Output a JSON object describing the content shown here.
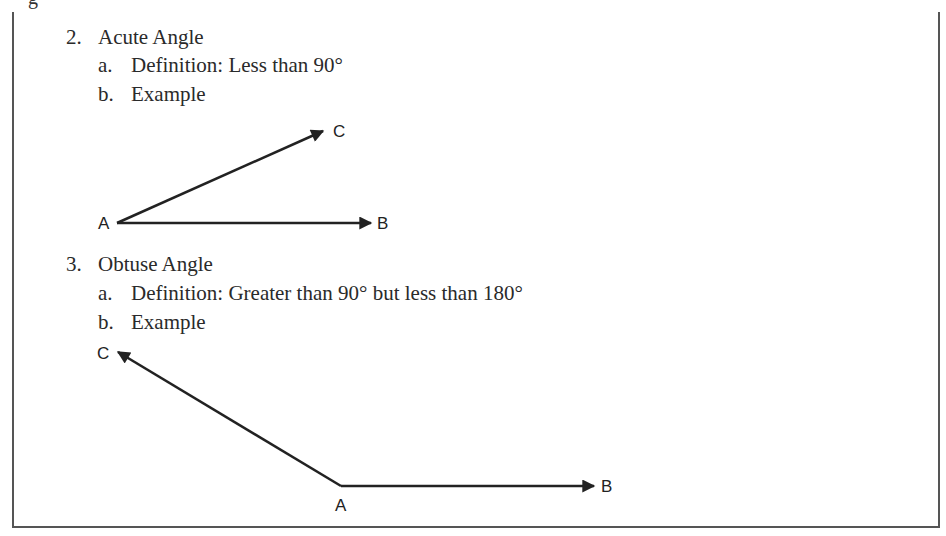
{
  "header_cutoff": "g",
  "sections": [
    {
      "number": "2.",
      "title": "Acute Angle",
      "items": [
        {
          "marker": "a.",
          "text": "Definition:  Less than 90°"
        },
        {
          "marker": "b.",
          "text": "Example"
        }
      ],
      "diagram": {
        "vertex": {
          "label": "A",
          "x": 117,
          "y": 223
        },
        "rays": [
          {
            "label": "C",
            "to": {
              "x": 323,
              "y": 131
            }
          },
          {
            "label": "B",
            "to": {
              "x": 371,
              "y": 223
            }
          }
        ]
      }
    },
    {
      "number": "3.",
      "title": "Obtuse Angle",
      "items": [
        {
          "marker": "a.",
          "text": "Definition: Greater than 90° but less than 180°"
        },
        {
          "marker": "b.",
          "text": "Example"
        }
      ],
      "diagram": {
        "vertex": {
          "label": "A",
          "x": 341,
          "y": 486
        },
        "rays": [
          {
            "label": "C",
            "to": {
              "x": 118,
              "y": 352
            }
          },
          {
            "label": "B",
            "to": {
              "x": 594,
              "y": 486
            }
          }
        ]
      }
    }
  ]
}
